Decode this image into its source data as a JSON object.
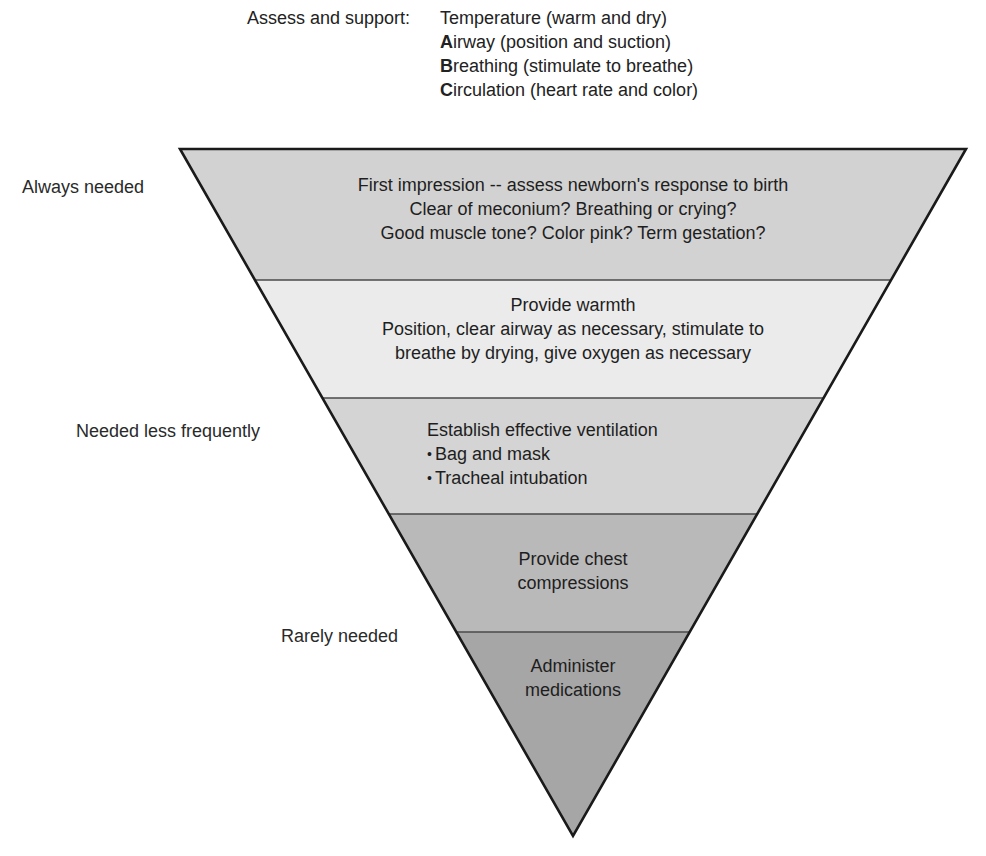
{
  "header": {
    "label": "Assess and support:",
    "items": [
      {
        "initial": "",
        "rest": "Temperature (warm and dry)"
      },
      {
        "initial": "A",
        "rest": "irway (position and suction)"
      },
      {
        "initial": "B",
        "rest": "reathing (stimulate to breathe)"
      },
      {
        "initial": "C",
        "rest": "irculation (heart rate and color)"
      }
    ]
  },
  "side_labels": {
    "always": "Always needed",
    "less": "Needed less frequently",
    "rarely": "Rarely needed"
  },
  "bands": [
    {
      "name": "first-impression",
      "fill": "#d2d2d2",
      "lines": [
        "First impression -- assess newborn's response to birth",
        "Clear of meconium? Breathing or crying?",
        "Good muscle tone? Color pink? Term gestation?"
      ]
    },
    {
      "name": "provide-warmth",
      "fill": "#ebebeb",
      "lines": [
        "Provide warmth",
        "Position, clear airway as necessary, stimulate to",
        "breathe by drying, give oxygen as necessary"
      ]
    },
    {
      "name": "ventilation",
      "fill": "#d4d4d4",
      "title": "Establish effective ventilation",
      "bullets": [
        "Bag and mask",
        "Tracheal intubation"
      ]
    },
    {
      "name": "chest-compressions",
      "fill": "#b9b9b9",
      "lines": [
        "Provide chest",
        "compressions"
      ]
    },
    {
      "name": "medications",
      "fill": "#a6a6a6",
      "lines": [
        "Administer",
        "medications"
      ]
    }
  ],
  "colors": {
    "outline": "#1a1a1a",
    "divider": "#4a4a4a",
    "text": "#1e1e1e"
  }
}
